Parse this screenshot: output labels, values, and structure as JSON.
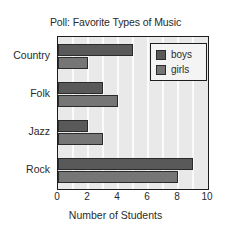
{
  "chart_data": {
    "type": "bar",
    "orientation": "horizontal",
    "title": "Poll: Favorite Types of Music",
    "xlabel": "Number of Students",
    "ylabel": "",
    "categories": [
      "Country",
      "Folk",
      "Jazz",
      "Rock"
    ],
    "series": [
      {
        "name": "boys",
        "color": "#595959",
        "values": [
          5,
          3,
          2,
          9
        ]
      },
      {
        "name": "girls",
        "color": "#767676",
        "values": [
          2,
          4,
          3,
          8
        ]
      }
    ],
    "xlim": [
      0,
      10
    ],
    "xticks": [
      0,
      2,
      4,
      6,
      8,
      10
    ],
    "xtick_labels": [
      "0",
      "2",
      "4",
      "6",
      "8",
      "10"
    ],
    "grid": true,
    "grid_axis": "x",
    "grid_interval": 1,
    "legend_position": "top-right",
    "plot_background": "#e9e9e9",
    "axis_color": "#1d1d1d"
  },
  "legend": {
    "entries": [
      {
        "label": "boys"
      },
      {
        "label": "girls"
      }
    ]
  }
}
